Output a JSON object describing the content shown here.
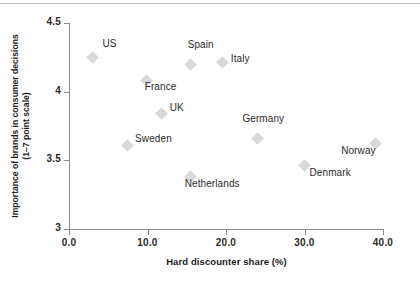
{
  "chart_data": {
    "type": "scatter",
    "title": "",
    "xlabel": "Hard discounter share (%)",
    "ylabel": "Importance of brands in consumer decisions\n(1–7 point scale)",
    "ylabel_line1": "Importance of brands in consumer decisions",
    "ylabel_line2": "(1–7 point scale)",
    "xlim": [
      0,
      40
    ],
    "ylim": [
      3,
      4.5
    ],
    "xticks": [
      0,
      10,
      20,
      30,
      40
    ],
    "xticklabels": [
      "0.0",
      "10.0",
      "20.0",
      "30.0",
      "40.0"
    ],
    "yticks": [
      3,
      3.5,
      4,
      4.5
    ],
    "yticklabels": [
      "3",
      "3.5",
      "4",
      "4.5"
    ],
    "grid": false,
    "legend": "none",
    "marker_shape": "diamond",
    "marker_color": "#d9d9d9",
    "axis_color": "#8a8a8a",
    "text_color": "#2b2b2b",
    "points": [
      {
        "label": "US",
        "x": 3.0,
        "y": 4.25,
        "label_dx": 10,
        "label_dy": -13
      },
      {
        "label": "Spain",
        "x": 15.5,
        "y": 4.2,
        "label_dx": -3,
        "label_dy": -19
      },
      {
        "label": "Italy",
        "x": 19.6,
        "y": 4.21,
        "label_dx": 8,
        "label_dy": -4
      },
      {
        "label": "France",
        "x": 9.9,
        "y": 4.08,
        "label_dx": -2,
        "label_dy": 6
      },
      {
        "label": "UK",
        "x": 11.8,
        "y": 3.84,
        "label_dx": 8,
        "label_dy": -6
      },
      {
        "label": "Germany",
        "x": 24.0,
        "y": 3.66,
        "label_dx": -15,
        "label_dy": -19
      },
      {
        "label": "Sweden",
        "x": 7.4,
        "y": 3.61,
        "label_dx": 8,
        "label_dy": -6
      },
      {
        "label": "Norway",
        "x": 39.0,
        "y": 3.62,
        "label_dx": -34,
        "label_dy": 7
      },
      {
        "label": "Denmark",
        "x": 30.0,
        "y": 3.46,
        "label_dx": 5,
        "label_dy": 7
      },
      {
        "label": "Netherlands",
        "x": 15.5,
        "y": 3.38,
        "label_dx": -6,
        "label_dy": 7
      }
    ]
  }
}
